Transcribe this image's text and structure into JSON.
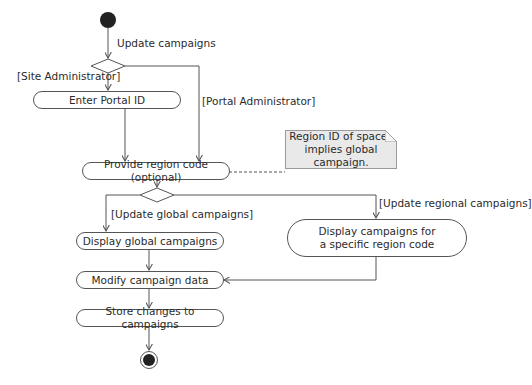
{
  "diagram": {
    "type": "UML activity diagram",
    "start_node": {
      "label": "initial-node"
    },
    "flows": {
      "start_to_decision": "Update campaigns",
      "guard_site_admin": "[Site Administrator]",
      "guard_portal_admin": "[Portal Administrator]",
      "guard_global": "[Update global campaigns]",
      "guard_regional": "[Update regional campaigns]"
    },
    "activities": {
      "enter_portal_id": "Enter Portal ID",
      "provide_region_code": "Provide region code (optional)",
      "display_global": "Display global campaigns",
      "display_regional_line1": "Display campaigns for",
      "display_regional_line2": "a specific region code",
      "modify_data": "Modify campaign data",
      "store_changes": "Store changes to campaigns"
    },
    "note": {
      "line1": "Region ID of spaces",
      "line2": "implies global campaign."
    },
    "colors": {
      "line": "#555555",
      "note_fill": "#e9e9e9",
      "node_fill": "#222222"
    }
  }
}
